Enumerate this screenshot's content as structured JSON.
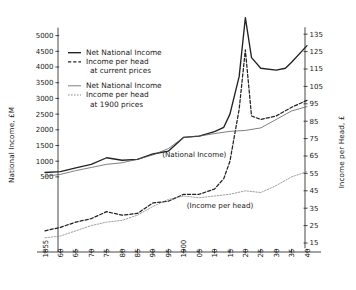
{
  "chart_data": {
    "type": "line",
    "title": "",
    "xlabel": "",
    "ylabel": "National Income,  £M",
    "y2label": "Income per Head,  £",
    "grid": false,
    "legend_position": "upper-left-inside",
    "xlim": [
      1855,
      1942
    ],
    "ylim": [
      0,
      5200
    ],
    "y2lim": [
      10,
      140
    ],
    "xticklabels": [
      "1855",
      "60",
      "65",
      "70",
      "75",
      "80",
      "85",
      "90",
      "95",
      "1900",
      "05",
      "10",
      "15",
      "20",
      "25",
      "30",
      "35",
      "40"
    ],
    "xtickvalues": [
      1855,
      1860,
      1865,
      1870,
      1875,
      1880,
      1885,
      1890,
      1895,
      1900,
      1905,
      1910,
      1915,
      1920,
      1925,
      1930,
      1935,
      1940
    ],
    "yticklabels": [
      "500",
      "1000",
      "1500",
      "2000",
      "2500",
      "3000",
      "3500",
      "4000",
      "4500",
      "5000"
    ],
    "ytickvalues": [
      500,
      1000,
      1500,
      2000,
      2500,
      3000,
      3500,
      4000,
      4500,
      5000
    ],
    "y2ticklabels": [
      "15",
      "25",
      "35",
      "45",
      "55",
      "65",
      "75",
      "85",
      "95",
      "105",
      "115",
      "125",
      "135"
    ],
    "y2tickvalues": [
      15,
      25,
      35,
      45,
      55,
      65,
      75,
      85,
      95,
      105,
      115,
      125,
      135
    ],
    "annotations": [
      {
        "text": "(National Income)",
        "x": 1893,
        "y": 1130
      },
      {
        "text": "(Income per head)",
        "x": 1901,
        "y": 330
      }
    ],
    "series": [
      {
        "name": "Net National Income",
        "sublabel": "at current prices",
        "style": "solid-thick",
        "axis": "left",
        "color": "#222222",
        "x": [
          1855,
          1860,
          1865,
          1870,
          1875,
          1880,
          1885,
          1890,
          1895,
          1900,
          1905,
          1910,
          1913,
          1915,
          1918,
          1920,
          1922,
          1925,
          1930,
          1933,
          1935,
          1940
        ],
        "y": [
          640,
          670,
          790,
          900,
          1110,
          1030,
          1060,
          1230,
          1320,
          1760,
          1800,
          1940,
          2080,
          2500,
          3700,
          5570,
          4300,
          3960,
          3900,
          3960,
          4150,
          4680
        ]
      },
      {
        "name": "Income per head",
        "sublabel": "at current prices",
        "style": "dashed-thick",
        "axis": "right",
        "color": "#222222",
        "x": [
          1855,
          1860,
          1865,
          1870,
          1875,
          1880,
          1885,
          1890,
          1895,
          1900,
          1905,
          1910,
          1913,
          1915,
          1918,
          1920,
          1922,
          1925,
          1930,
          1935,
          1940
        ],
        "y": [
          22,
          24,
          27,
          29,
          33,
          31,
          32,
          38,
          39,
          43,
          43,
          46,
          52,
          62,
          92,
          126,
          88,
          86,
          88,
          93,
          97
        ]
      },
      {
        "name": "Net National Income",
        "sublabel": "at 1900 prices",
        "style": "solid-thin",
        "axis": "left",
        "color": "#555555",
        "x": [
          1855,
          1860,
          1865,
          1870,
          1875,
          1880,
          1885,
          1890,
          1895,
          1900,
          1905,
          1910,
          1915,
          1920,
          1925,
          1930,
          1935,
          1940
        ],
        "y": [
          520,
          580,
          700,
          800,
          900,
          950,
          1060,
          1200,
          1400,
          1760,
          1800,
          1880,
          1950,
          1980,
          2060,
          2330,
          2600,
          2740
        ]
      },
      {
        "name": "Income per head",
        "sublabel": "at 1900 prices",
        "style": "dotted-thin",
        "axis": "right",
        "color": "#777777",
        "x": [
          1855,
          1860,
          1865,
          1870,
          1875,
          1880,
          1885,
          1890,
          1895,
          1900,
          1905,
          1910,
          1915,
          1920,
          1925,
          1930,
          1935,
          1940
        ],
        "y": [
          18,
          19,
          22,
          25,
          27,
          28,
          31,
          36,
          40,
          42,
          41,
          42,
          43,
          45,
          44,
          48,
          53,
          56
        ]
      }
    ]
  },
  "legend": {
    "entries": [
      {
        "label": "Net National Income",
        "sublabel": "",
        "style": "solid-thick"
      },
      {
        "label": "Income per head",
        "sublabel": "at current prices",
        "style": "dashed-thick"
      },
      {
        "label": "Net National Income",
        "sublabel": "",
        "style": "solid-thin"
      },
      {
        "label": "Income per head",
        "sublabel": "at 1900 prices",
        "style": "dotted-thin"
      }
    ]
  }
}
